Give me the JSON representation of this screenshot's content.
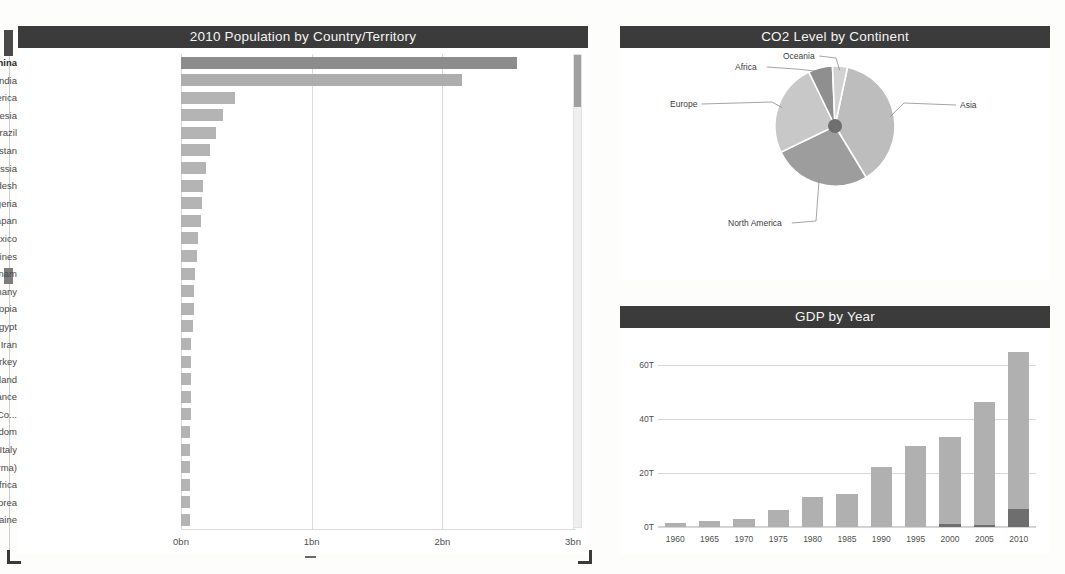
{
  "bar_panel": {
    "title": "2010 Population by Country/Territory",
    "scrollbar": {
      "name": "vertical-scrollbar"
    }
  },
  "pie_panel": {
    "title": "CO2 Level by Continent"
  },
  "gdp_panel": {
    "title": "GDP by Year"
  },
  "chart_data": [
    {
      "type": "bar",
      "orientation": "horizontal",
      "title": "2010 Population by Country/Territory",
      "xlabel": "",
      "ylabel": "",
      "xlim": [
        0,
        3
      ],
      "unit": "bn",
      "grid": true,
      "tick_labels": [
        "0bn",
        "1bn",
        "2bn",
        "3bn"
      ],
      "tick_values": [
        0,
        1,
        2,
        3
      ],
      "categories": [
        "China",
        "India",
        "United States of America",
        "Indonesia",
        "Brazil",
        "Pakistan",
        "Russia",
        "Bangladesh",
        "Nigeria",
        "Japan",
        "Mexico",
        "Philippines",
        "Vietnam",
        "Germany",
        "Ethiopia",
        "Egypt",
        "Iran",
        "Turkey",
        "Thailand",
        "France",
        "Democratic Republic of the Co...",
        "United Kingdom",
        "Italy",
        "Myanmar (Burma)",
        "South Africa",
        "South Korea",
        "Ukraine"
      ],
      "values": [
        2.57,
        2.15,
        0.41,
        0.32,
        0.27,
        0.22,
        0.19,
        0.17,
        0.16,
        0.15,
        0.13,
        0.12,
        0.11,
        0.1,
        0.1,
        0.09,
        0.08,
        0.08,
        0.08,
        0.08,
        0.08,
        0.07,
        0.07,
        0.07,
        0.07,
        0.07,
        0.07
      ]
    },
    {
      "type": "pie",
      "title": "CO2 Level by Continent",
      "legend_position": "callout-labels",
      "labels": [
        "Asia",
        "North America",
        "Europe",
        "Africa",
        "Oceania"
      ],
      "values": [
        38.0,
        26.5,
        25.0,
        6.5,
        4.0
      ]
    },
    {
      "type": "bar",
      "orientation": "vertical",
      "stacked": true,
      "title": "GDP by Year",
      "xlabel": "",
      "ylabel": "",
      "ylim": [
        0,
        70
      ],
      "unit": "T",
      "grid": true,
      "ytick_labels": [
        "0T",
        "20T",
        "40T",
        "60T"
      ],
      "ytick_values": [
        0,
        20,
        40,
        60
      ],
      "categories": [
        "1960",
        "1965",
        "1970",
        "1975",
        "1980",
        "1985",
        "1990",
        "1995",
        "2000",
        "2005",
        "2010"
      ],
      "series": [
        {
          "name": "lower-segment",
          "color": "#6e6e6e",
          "values": [
            0,
            0,
            0,
            0,
            0,
            0,
            0,
            0,
            1.2,
            0.6,
            6.5
          ]
        },
        {
          "name": "upper-segment",
          "color": "#b0b0b0",
          "values": [
            1.4,
            2.1,
            3.1,
            6.2,
            11.0,
            12.3,
            22.2,
            30.0,
            32.2,
            45.6,
            58.5
          ]
        }
      ],
      "totals": [
        1.4,
        2.1,
        3.1,
        6.2,
        11.0,
        12.3,
        22.2,
        30.0,
        33.4,
        46.2,
        65.0
      ]
    }
  ],
  "colors": {
    "panel_header": "#3b3b3b",
    "bar_primary": "#8c8c8c",
    "bar_secondary": "#adadad",
    "bar_default": "#b4b4b4",
    "gdp_upper": "#b0b0b0",
    "gdp_lower": "#6e6e6e",
    "gridline": "#d9d9d9",
    "background": "#ffffff"
  }
}
